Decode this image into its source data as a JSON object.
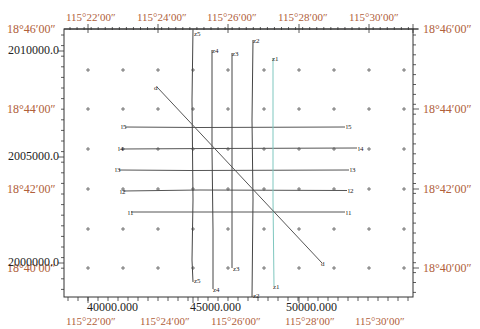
{
  "map": {
    "type": "survey-line-layout",
    "colors": {
      "frame": "#333333",
      "degree_label": "#b0603a",
      "projected_label": "#222222",
      "survey_line": "#444444",
      "highlight_line": "#7fc7bf",
      "grid_mark": "#555555"
    },
    "top_axis": [
      "115°22′00″",
      "115°24′00″",
      "115°26′00″",
      "115°28′00″",
      "115°30′00″"
    ],
    "bottom_axis_degrees": [
      "115°22′00″",
      "115°24′00″",
      "115°26′00″",
      "115°28′00″",
      "115°30′00″"
    ],
    "bottom_axis_projected": [
      "40000.000",
      "45000.000",
      "50000.000"
    ],
    "left_axis_degrees": [
      "18°46′00″",
      "18°44′00″",
      "18°42′00″",
      "18°40′00″"
    ],
    "left_axis_projected": [
      "2010000.0",
      "2005000.0",
      "2000000.0"
    ],
    "right_axis": [
      "18°46′00″",
      "18°44′00″",
      "18°42′00″",
      "18°40′00″"
    ],
    "horizontal_lines": [
      {
        "start_label": "l5",
        "end_label": "l5"
      },
      {
        "start_label": "l4",
        "end_label": "l4"
      },
      {
        "start_label": "l3",
        "end_label": "l3"
      },
      {
        "start_label": "l2",
        "end_label": "l2"
      },
      {
        "start_label": "l1",
        "end_label": "l1"
      }
    ],
    "vertical_lines": [
      {
        "top_label": "z5",
        "bottom_label": "z5"
      },
      {
        "top_label": "z4",
        "bottom_label": "z4"
      },
      {
        "top_label": "z3",
        "bottom_label": "z3"
      },
      {
        "top_label": "z2",
        "bottom_label": "z2"
      },
      {
        "top_label": "z1",
        "bottom_label": "z1"
      }
    ],
    "diagonal_line": {
      "start_label": "d",
      "end_label": "d"
    }
  }
}
